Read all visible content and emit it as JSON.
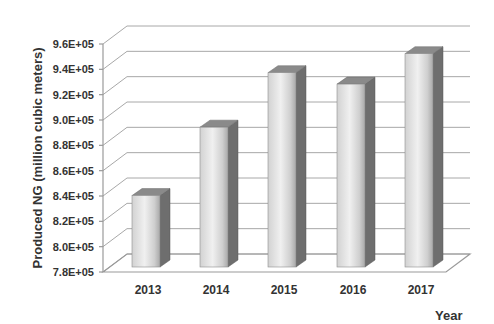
{
  "chart_data": {
    "type": "bar",
    "style": "3d-column",
    "title": "",
    "xlabel": "Year",
    "ylabel": "Produced NG (million cubic meters)",
    "categories": [
      "2013",
      "2014",
      "2015",
      "2016",
      "2017"
    ],
    "values": [
      836000,
      890000,
      933000,
      924000,
      948000
    ],
    "ylim": [
      780000,
      960000
    ],
    "yticks": [
      780000,
      800000,
      820000,
      840000,
      860000,
      880000,
      900000,
      920000,
      940000,
      960000
    ],
    "ytick_labels": [
      "7.8E+05",
      "8.0E+05",
      "8.2E+05",
      "8.4E+05",
      "8.6E+05",
      "8.8E+05",
      "9.0E+05",
      "9.2E+05",
      "9.4E+05",
      "9.6E+05"
    ],
    "grid": true,
    "legend": null,
    "colors": {
      "bar_front_light": "#f0f0f0",
      "bar_front_mid": "#d6d6d6",
      "bar_front_dark": "#a9a9a9",
      "bar_side": "#6e6e6e",
      "bar_top": "#8a8a8a",
      "gridline": "#a8a8a8",
      "text": "#333333"
    }
  }
}
